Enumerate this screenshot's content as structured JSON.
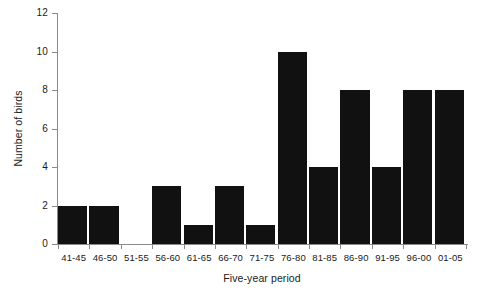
{
  "chart_data": {
    "type": "bar",
    "title": "",
    "xlabel": "Five-year period",
    "ylabel": "Number of birds",
    "categories": [
      "41-45",
      "46-50",
      "51-55",
      "56-60",
      "61-65",
      "66-70",
      "71-75",
      "76-80",
      "81-85",
      "86-90",
      "91-95",
      "96-00",
      "01-05"
    ],
    "values": [
      2,
      2,
      0,
      3,
      1,
      3,
      1,
      10,
      4,
      8,
      4,
      8,
      8
    ],
    "ylim": [
      0,
      12
    ],
    "yticks": [
      0,
      2,
      4,
      6,
      8,
      10,
      12
    ],
    "ytick_labels": [
      "0",
      "2",
      "4",
      "6",
      "8",
      "10",
      "12"
    ],
    "grid": false,
    "legend": false,
    "bar_color": "#111111",
    "axis_color": "#8a8a8a",
    "background": "#ffffff"
  }
}
